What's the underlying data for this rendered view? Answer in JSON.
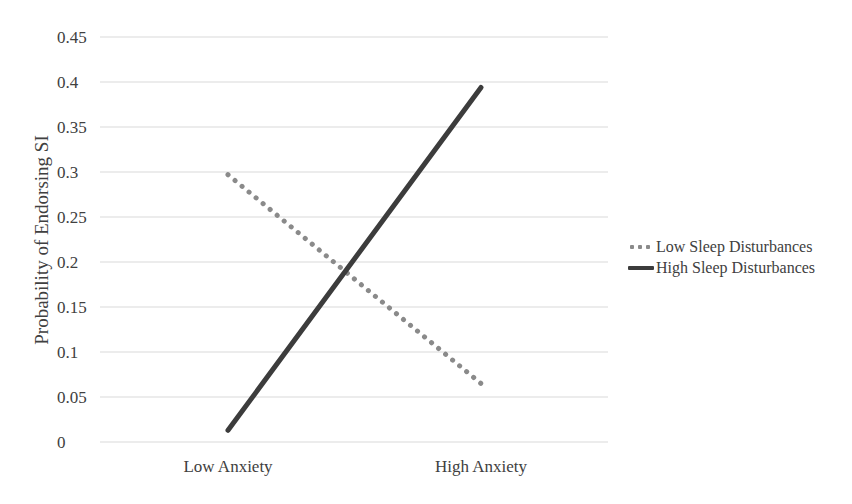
{
  "chart_data": {
    "type": "line",
    "title": "",
    "xlabel": "",
    "ylabel": "Probability of Endorsing SI",
    "categories": [
      "Low Anxiety",
      "High Anxiety"
    ],
    "series": [
      {
        "name": "Low Sleep Disturbances",
        "values": [
          0.297,
          0.065
        ],
        "style": "dotted",
        "color": "#8a8a8a"
      },
      {
        "name": "High Sleep Disturbances",
        "values": [
          0.013,
          0.394
        ],
        "style": "solid",
        "color": "#3c3c3c"
      }
    ],
    "ylim": [
      0,
      0.45
    ],
    "yticks": [
      "0",
      "0.05",
      "0.1",
      "0.15",
      "0.2",
      "0.25",
      "0.3",
      "0.35",
      "0.4",
      "0.45"
    ],
    "grid": true,
    "legend_position": "right"
  },
  "legend": {
    "items": [
      {
        "label": "Low Sleep Disturbances"
      },
      {
        "label": "High Sleep Disturbances"
      }
    ]
  }
}
